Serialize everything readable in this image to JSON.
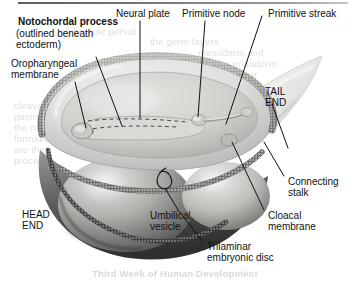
{
  "figure": {
    "type": "anatomical-illustration",
    "style": "grayscale halftone textbook figure",
    "colors": {
      "page_background": "#ffffff",
      "label_text": "#111111",
      "leader_line": "#1a1a1a",
      "ghost_text": "#d8d8d8",
      "top_rule": "#5d5d5d",
      "amnion_light": "#e9e9e7",
      "disc_surface": "#d6d6d4",
      "disc_shadow": "#8f8f8d",
      "vesicle_mid": "#b9b9b7",
      "vesicle_dark": "#595957",
      "stalk_light": "#f0f0ee"
    }
  },
  "labels": [
    {
      "id": "notochordal-process",
      "bold_text": "Notochordal process",
      "sub_line1": "(outlined beneath",
      "sub_line2": "ectoderm)",
      "x": 18,
      "y": 18,
      "emphasis": "bold"
    },
    {
      "id": "oropharyngeal-membrane",
      "line1": "Oropharyngeal",
      "line2": "membrane",
      "x": 11,
      "y": 60
    },
    {
      "id": "neural-plate",
      "line1": "Neural plate",
      "x": 116,
      "y": 9
    },
    {
      "id": "primitive-node",
      "line1": "Primitive node",
      "x": 182,
      "y": 9
    },
    {
      "id": "primitive-streak",
      "line1": "Primitive streak",
      "x": 266,
      "y": 9
    },
    {
      "id": "tail-end",
      "line1": "TAIL",
      "line2": "END",
      "x": 265,
      "y": 88
    },
    {
      "id": "head-end",
      "line1": "HEAD",
      "line2": "END",
      "x": 22,
      "y": 211
    },
    {
      "id": "connecting-stalk",
      "line1": "Connecting",
      "line2": "stalk",
      "x": 288,
      "y": 178
    },
    {
      "id": "cloacal-membrane",
      "line1": "Cloacal",
      "line2": "membrane",
      "x": 268,
      "y": 212
    },
    {
      "id": "umbilical-vesicle",
      "line1": "Umbilical",
      "line2": "vesicle",
      "x": 150,
      "y": 212
    },
    {
      "id": "trilaminar-embryonic-disc",
      "line1": "Trilaminar",
      "line2": "embryonic disc",
      "x": 207,
      "y": 243
    }
  ],
  "ghost_text": [
    {
      "text": "cleavage",
      "x": 14,
      "y": 100,
      "bold": false
    },
    {
      "text": "gastrulation",
      "x": 14,
      "y": 111,
      "bold": false
    },
    {
      "text": "the notochord",
      "x": 14,
      "y": 122,
      "bold": false
    },
    {
      "text": "formation",
      "x": 14,
      "y": 133,
      "bold": false
    },
    {
      "text": "are the",
      "x": 14,
      "y": 144,
      "bold": false
    },
    {
      "text": "process",
      "x": 14,
      "y": 155,
      "bold": false
    },
    {
      "text": "embryonic period",
      "x": 60,
      "y": 26,
      "bold": false
    },
    {
      "text": "the germ layers",
      "x": 150,
      "y": 36,
      "bold": false
    },
    {
      "text": "mesoderm and",
      "x": 198,
      "y": 47,
      "bold": false
    },
    {
      "text": "the endoderm",
      "x": 216,
      "y": 58,
      "bold": false
    },
    {
      "text": "layer",
      "x": 236,
      "y": 69,
      "bold": false
    },
    {
      "text": "Third Week of Human Development",
      "x": 92,
      "y": 268,
      "bold": true
    }
  ]
}
